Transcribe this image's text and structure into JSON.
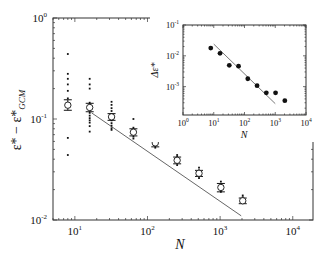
{
  "chart_data": [
    {
      "type": "scatter",
      "title": "",
      "xlabel": "N",
      "ylabel": "ε* − ε*_GCM",
      "xscale": "log",
      "yscale": "log",
      "xlim": [
        5,
        19000
      ],
      "ylim": [
        0.01,
        1
      ],
      "x_ticks": [
        10,
        100,
        1000,
        10000
      ],
      "x_tick_labels": [
        "10^1",
        "10^2",
        "10^3",
        "10^4"
      ],
      "y_ticks": [
        0.01,
        0.1,
        1
      ],
      "y_tick_labels": [
        "10^-2",
        "10^-1",
        "10^0"
      ],
      "grid": false,
      "legend": null,
      "series": [
        {
          "name": "mean (open circles with error bars)",
          "marker": "open-circle",
          "x": [
            8,
            16,
            32,
            64,
            128,
            256,
            512,
            1024,
            2048
          ],
          "y": [
            0.137,
            0.13,
            0.105,
            0.074,
            0.058,
            0.039,
            0.029,
            0.021,
            0.0155
          ],
          "err_low": [
            0.122,
            0.118,
            0.097,
            0.068,
            0.053,
            0.036,
            0.027,
            0.019,
            0.0145
          ],
          "err_high": [
            0.155,
            0.143,
            0.113,
            0.08,
            0.063,
            0.042,
            0.031,
            0.023,
            0.0165
          ]
        },
        {
          "name": "individual samples (small dots)",
          "marker": "dot",
          "points": [
            [
              8,
              0.44
            ],
            [
              8,
              0.28
            ],
            [
              8,
              0.25
            ],
            [
              8,
              0.22
            ],
            [
              8,
              0.19
            ],
            [
              8,
              0.14
            ],
            [
              8,
              0.16
            ],
            [
              8,
              0.065
            ],
            [
              8,
              0.044
            ],
            [
              16,
              0.25
            ],
            [
              16,
              0.22
            ],
            [
              16,
              0.2
            ],
            [
              16,
              0.145
            ],
            [
              16,
              0.125
            ],
            [
              16,
              0.115
            ],
            [
              16,
              0.108
            ],
            [
              16,
              0.102
            ],
            [
              16,
              0.097
            ],
            [
              16,
              0.092
            ],
            [
              16,
              0.085
            ],
            [
              16,
              0.075
            ],
            [
              32,
              0.148
            ],
            [
              32,
              0.138
            ],
            [
              32,
              0.128
            ],
            [
              32,
              0.12
            ],
            [
              32,
              0.112
            ],
            [
              32,
              0.104
            ],
            [
              32,
              0.097
            ],
            [
              32,
              0.091
            ],
            [
              32,
              0.086
            ],
            [
              32,
              0.081
            ],
            [
              32,
              0.078
            ],
            [
              64,
              0.1
            ],
            [
              64,
              0.082
            ],
            [
              64,
              0.077
            ],
            [
              64,
              0.071
            ],
            [
              64,
              0.067
            ],
            [
              64,
              0.064
            ],
            [
              128,
              0.066
            ],
            [
              128,
              0.062
            ],
            [
              128,
              0.055
            ],
            [
              128,
              0.052
            ],
            [
              256,
              0.044
            ],
            [
              256,
              0.042
            ],
            [
              256,
              0.037
            ],
            [
              256,
              0.035
            ],
            [
              512,
              0.033
            ],
            [
              512,
              0.031
            ],
            [
              512,
              0.027
            ],
            [
              512,
              0.026
            ],
            [
              1024,
              0.024
            ],
            [
              1024,
              0.022
            ],
            [
              1024,
              0.02
            ],
            [
              1024,
              0.019
            ],
            [
              2048,
              0.0175
            ],
            [
              2048,
              0.0168
            ]
          ]
        },
        {
          "name": "power-law fit ~ N^-1/2",
          "type": "line",
          "x": [
            17,
            1950
          ],
          "y": [
            0.115,
            0.011
          ]
        }
      ]
    },
    {
      "type": "scatter",
      "title": "inset",
      "xlabel": "N",
      "ylabel": "Δε*",
      "xscale": "log",
      "yscale": "log",
      "xlim": [
        1,
        10000
      ],
      "ylim": [
        0.00012,
        0.1
      ],
      "x_ticks": [
        1,
        10,
        100,
        1000,
        10000
      ],
      "x_tick_labels": [
        "10^0",
        "10^1",
        "10^2",
        "10^3",
        "10^4"
      ],
      "y_ticks": [
        0.001,
        0.01,
        0.1
      ],
      "y_tick_labels": [
        "10^-3",
        "10^-2",
        "10^-1"
      ],
      "grid": false,
      "legend": null,
      "series": [
        {
          "name": "Δε* (filled circles)",
          "marker": "filled-circle",
          "x": [
            8,
            16,
            32,
            64,
            128,
            256,
            512,
            1024,
            2048
          ],
          "y": [
            0.0178,
            0.012,
            0.0049,
            0.0046,
            0.0018,
            0.00107,
            0.00063,
            0.00063,
            0.00035
          ]
        },
        {
          "name": "power-law fit",
          "type": "line",
          "x": [
            10,
            1000
          ],
          "y": [
            0.024,
            0.00028
          ]
        }
      ]
    }
  ],
  "labels": {
    "main_xlabel": "N",
    "main_ylabel_base": "ε* − ε*",
    "main_ylabel_sub": "GCM",
    "inset_xlabel": "N",
    "inset_ylabel": "Δε*"
  }
}
